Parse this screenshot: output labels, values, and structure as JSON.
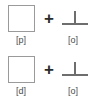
{
  "diagram": {
    "background_color": "#ffffff",
    "stroke_color": "#9a9a9a",
    "glyph_color": "#6e6e6e",
    "label_color": "#4d4d4d",
    "operator_color": "#2b2b2b",
    "rows": [
      {
        "operator": "+",
        "left": {
          "shape": "empty-square",
          "label": "[p]"
        },
        "right": {
          "shape": "up-tack",
          "label": "[o]"
        }
      },
      {
        "operator": "+",
        "left": {
          "shape": "empty-square",
          "label": "[d]"
        },
        "right": {
          "shape": "up-tack",
          "label": "[o]"
        }
      }
    ]
  }
}
